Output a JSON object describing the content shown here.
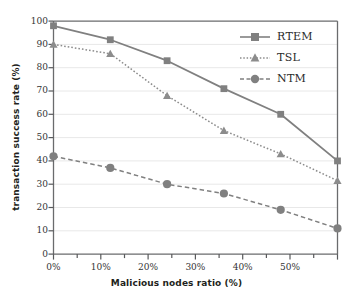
{
  "chart_data": {
    "type": "line",
    "title": "",
    "xlabel": "Malicious nodes ratio (%)",
    "ylabel": "transaction success rate (%)",
    "x": [
      0,
      10,
      20,
      30,
      40,
      50
    ],
    "categories": [
      "0%",
      "10%",
      "20%",
      "30%",
      "40%",
      "50%"
    ],
    "xtick_labels": [
      "0%",
      "10%",
      "20%",
      "30%",
      "40%",
      "50%"
    ],
    "ytick_labels": [
      "0",
      "10",
      "20",
      "30",
      "40",
      "50",
      "60",
      "70",
      "80",
      "90",
      "100"
    ],
    "ytick_values": [
      0,
      10,
      20,
      30,
      40,
      50,
      60,
      70,
      80,
      90,
      100
    ],
    "xlim": [
      0,
      50
    ],
    "ylim": [
      0,
      100
    ],
    "grid": "horizontal",
    "legend_position": "top-right-inside",
    "series": [
      {
        "name": "RTEM",
        "values": [
          98,
          92,
          83,
          71,
          60,
          40
        ],
        "marker": "square",
        "line_style": "solid",
        "color": "#808080"
      },
      {
        "name": "TSL",
        "values": [
          90,
          86,
          68,
          53,
          43,
          31.5
        ],
        "marker": "triangle",
        "line_style": "dotted",
        "color": "#8c8c8c"
      },
      {
        "name": "NTM",
        "values": [
          42,
          37,
          30,
          26,
          19,
          11
        ],
        "marker": "circle",
        "line_style": "dashed",
        "color": "#808080"
      }
    ]
  },
  "colors": {
    "series_gray": "#808080",
    "axis": "#58595b",
    "grid": "#e6e6e6",
    "text": "#231f20",
    "background": "#ffffff"
  },
  "legend": {
    "items": [
      {
        "label": "RTEM"
      },
      {
        "label": "TSL"
      },
      {
        "label": "NTM"
      }
    ]
  }
}
